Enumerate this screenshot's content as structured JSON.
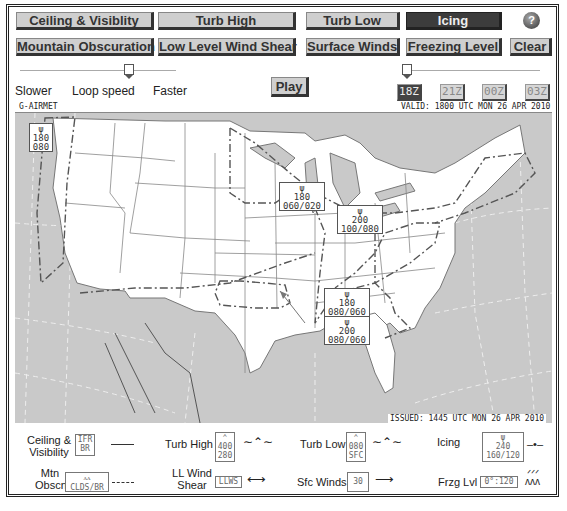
{
  "toolbar": {
    "row1": [
      "Ceiling & Visiblity",
      "Turb High",
      "Turb Low",
      "Icing"
    ],
    "row2": [
      "Mountain Obscuration",
      "Low Level Wind Shear",
      "Surface Winds",
      "Freezing Level"
    ],
    "active": "Icing",
    "clear_label": "Clear",
    "help_label": "?"
  },
  "loop": {
    "slower_label": "Slower",
    "speed_label": "Loop speed",
    "faster_label": "Faster",
    "play_label": "Play"
  },
  "times": {
    "items": [
      "18Z",
      "21Z",
      "00Z",
      "03Z"
    ],
    "active": "18Z"
  },
  "map": {
    "product_label": "G-AIRMET",
    "valid_text": "VALID: 1800 UTC MON 26 APR 2010",
    "issued_text": "ISSUED: 1445 UTC MON 26 APR 2010",
    "icing_stamps": [
      {
        "top": "180",
        "bottom": "080"
      },
      {
        "top": "180",
        "bottom": "060/020"
      },
      {
        "top": "200",
        "bottom": "100/080"
      },
      {
        "top": "180",
        "bottom": "080/060"
      },
      {
        "top": "200",
        "bottom": "080/060"
      }
    ],
    "colors": {
      "land": "#ffffff",
      "water": "#c9c9c9",
      "border": "#777777",
      "airmet_line": "#555555"
    }
  },
  "legend": {
    "ceiling": {
      "label1": "Ceiling &",
      "label2": "Visibility",
      "box1": "IFR",
      "box2": "BR"
    },
    "turb_high": {
      "label": "Turb High",
      "box1": "400",
      "box2": "280"
    },
    "turb_low": {
      "label": "Turb Low",
      "box1": "080",
      "box2": "SFC"
    },
    "icing": {
      "label": "Icing",
      "box1": "240",
      "box2": "160/120"
    },
    "mtn": {
      "label1": "Mtn",
      "label2": "Obscn",
      "box": "CLDS/BR"
    },
    "llws": {
      "label1": "LL Wind",
      "label2": "Shear",
      "box": "LLWS"
    },
    "sfc_winds": {
      "label": "Sfc  Winds",
      "box": "30"
    },
    "frzg": {
      "label": "Frzg Lvl",
      "box": "0°:120"
    }
  }
}
